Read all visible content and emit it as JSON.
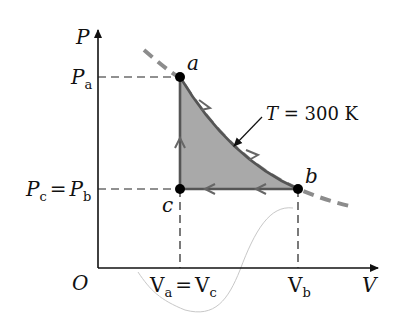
{
  "diagram": {
    "type": "PV diagram (thermodynamic cycle)",
    "axes": {
      "y_label": "P",
      "x_label": "V",
      "origin_label": "O"
    },
    "points": {
      "a": {
        "label": "a",
        "x": 180,
        "y": 77
      },
      "b": {
        "label": "b",
        "x": 298,
        "y": 189
      },
      "c": {
        "label": "c",
        "x": 180,
        "y": 189
      }
    },
    "tick_labels": {
      "pa": {
        "main": "P",
        "sub": "a"
      },
      "pcpb": {
        "left_main": "P",
        "left_sub": "c",
        "eq": "=",
        "right_main": "P",
        "right_sub": "b"
      },
      "vavc": {
        "left_main": "V",
        "left_sub": "a",
        "eq": "=",
        "right_main": "V",
        "right_sub": "c"
      },
      "vb": {
        "main": "V",
        "sub": "b"
      }
    },
    "isotherm_label": "T = 300 K",
    "colors": {
      "axis": "#111111",
      "path": "#555555",
      "fill": "#a9a9a9",
      "isotherm": "#8c8c8c",
      "point": "#000000"
    }
  }
}
